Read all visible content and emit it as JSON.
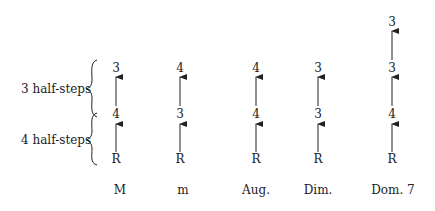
{
  "brackets": [
    {
      "label": "3 half-steps"
    },
    {
      "label": "4 half-steps"
    }
  ],
  "columns": [
    {
      "name": "M",
      "root": "R",
      "intervals": [
        "4",
        "3"
      ]
    },
    {
      "name": "m",
      "root": "R",
      "intervals": [
        "3",
        "4"
      ]
    },
    {
      "name": "Aug.",
      "root": "R",
      "intervals": [
        "4",
        "4"
      ]
    },
    {
      "name": "Dim.",
      "root": "R",
      "intervals": [
        "3",
        "3"
      ]
    },
    {
      "name": "Dom. 7",
      "root": "R",
      "intervals": [
        "4",
        "3",
        "3"
      ]
    }
  ],
  "colors": {
    "ink": "#222222",
    "background": "#ffffff"
  }
}
